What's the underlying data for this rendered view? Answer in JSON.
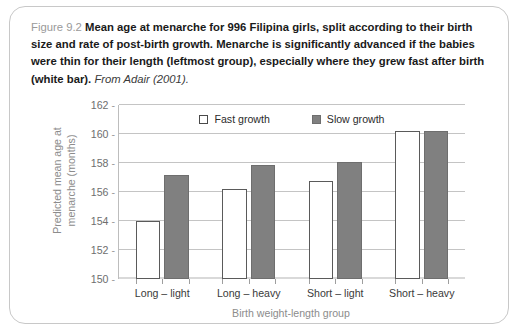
{
  "figure": {
    "number_label": "Figure 9.2",
    "caption_text": "Mean age at menarche for 996 Filipina girls, split according to their birth size and rate of post-birth growth. Menarche is significantly advanced if the babies were thin for their length (leftmost group), especially where they grew fast after birth (white bar).",
    "source": "From Adair (2001)."
  },
  "chart_data": {
    "type": "bar",
    "title": "",
    "xlabel": "Birth weight-length group",
    "ylabel": "Predicted mean age at menarche (months)",
    "ylabel_line1": "Predicted mean age at",
    "ylabel_line2": "menarche (months)",
    "categories": [
      "Long – light",
      "Long – heavy",
      "Short – light",
      "Short – heavy"
    ],
    "series": [
      {
        "name": "Fast growth",
        "color": "#ffffff",
        "edge": "#5a5a5a",
        "values": [
          154.0,
          156.2,
          156.75,
          160.2
        ]
      },
      {
        "name": "Slow growth",
        "color": "#808080",
        "edge": "#6e6e6e",
        "values": [
          157.2,
          157.85,
          158.1,
          160.2
        ]
      }
    ],
    "ylim": [
      150,
      162
    ],
    "yticks": [
      150,
      152,
      154,
      156,
      158,
      160,
      162
    ],
    "ytick_labels": [
      "150",
      "152",
      "154",
      "156",
      "158",
      "160",
      "162"
    ],
    "grid": true,
    "legend_position": "top-center"
  }
}
